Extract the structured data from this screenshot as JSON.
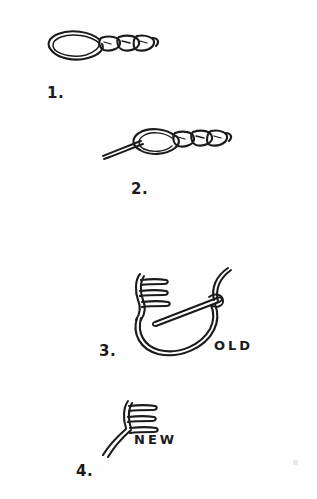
{
  "document": {
    "title": "Hook Replacement Knot Diagram",
    "medium": "hand-drawn ink line art",
    "background_color": "#fefefe",
    "ink_color": "#1b1b1b",
    "width": 317,
    "height": 499
  },
  "steps": [
    {
      "number": "1.",
      "number_x": 47,
      "number_y": 84,
      "caption": "",
      "description": "Doubled line forming a long open loop at left with three twisted coils to the right ending in a closed tip"
    },
    {
      "number": "2.",
      "number_x": 131,
      "number_y": 180,
      "caption": "",
      "description": "Same coiled loop with a single line threaded in from the lower left through the loop"
    },
    {
      "number": "3.",
      "number_x": 99,
      "number_y": 342,
      "caption": "OLD",
      "caption_x": 214,
      "caption_y": 338,
      "description": "Large open loop of line with three-pronged hook eye at upper left and a straight shank crossing to a knot at upper right"
    },
    {
      "number": "4.",
      "number_x": 76,
      "number_y": 462,
      "caption": "NEW",
      "caption_x": 134,
      "caption_y": 432,
      "description": "Three-pronged hook eye with doubled line descending to the lower left"
    }
  ],
  "annotations": [
    {
      "name": "old-hook-label",
      "text": "OLD"
    },
    {
      "name": "new-hook-label",
      "text": "NEW"
    }
  ],
  "artifacts": {
    "smudge": {
      "x": 293,
      "y": 460
    }
  }
}
